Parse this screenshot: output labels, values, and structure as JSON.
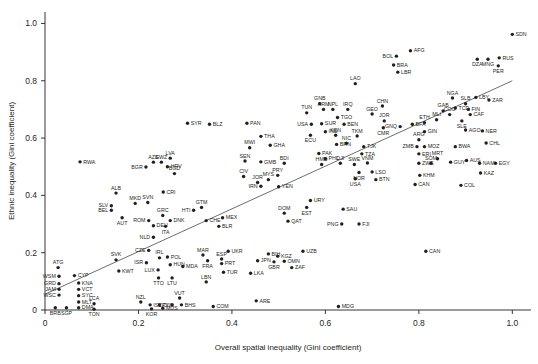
{
  "chart_data": {
    "type": "scatter",
    "title": "",
    "xlabel": "Overall spatial inequality (Gini coefficient)",
    "ylabel": "Ethnic inequality (Gini coefficient)",
    "xlim": [
      0,
      1.04
    ],
    "ylim": [
      0,
      1.04
    ],
    "xticks": [
      "0",
      "0.2",
      "0.4",
      "0.6",
      "0.8",
      "1.0"
    ],
    "xtickvals": [
      0,
      0.2,
      0.4,
      0.6,
      0.8,
      1.0
    ],
    "yticks": [
      "0",
      "0.2",
      "0.4",
      "0.6",
      "0.8",
      "1.0"
    ],
    "ytickvals": [
      0,
      0.2,
      0.4,
      0.6,
      0.8,
      1.0
    ],
    "grid": false,
    "legend": "none",
    "point_color": "#231f20",
    "trendline_color": "#6d6e71",
    "trendline": {
      "x0": 0.0,
      "y0": 0.055,
      "x1": 1.0,
      "y1": 0.8
    },
    "points": [
      {
        "label": "RWA",
        "x": 0.075,
        "y": 0.517,
        "lp": "r"
      },
      {
        "label": "SYR",
        "x": 0.305,
        "y": 0.652,
        "lp": "r"
      },
      {
        "label": "BLZ",
        "x": 0.352,
        "y": 0.648,
        "lp": "r"
      },
      {
        "label": "PAN",
        "x": 0.432,
        "y": 0.652,
        "lp": "r"
      },
      {
        "label": "THA",
        "x": 0.462,
        "y": 0.606,
        "lp": "r"
      },
      {
        "label": "GHA",
        "x": 0.482,
        "y": 0.575,
        "lp": "r"
      },
      {
        "label": "MWI",
        "x": 0.438,
        "y": 0.566,
        "lp": "t"
      },
      {
        "label": "SEN",
        "x": 0.428,
        "y": 0.52,
        "lp": "t"
      },
      {
        "label": "GMB",
        "x": 0.462,
        "y": 0.517,
        "lp": "r"
      },
      {
        "label": "BDI",
        "x": 0.512,
        "y": 0.512,
        "lp": "t"
      },
      {
        "label": "LVA",
        "x": 0.268,
        "y": 0.53,
        "lp": "t"
      },
      {
        "label": "AZE",
        "x": 0.232,
        "y": 0.516,
        "lp": "t"
      },
      {
        "label": "SWZ",
        "x": 0.249,
        "y": 0.516,
        "lp": "t"
      },
      {
        "label": "HRV",
        "x": 0.262,
        "y": 0.5,
        "lp": "r"
      },
      {
        "label": "BGR",
        "x": 0.216,
        "y": 0.499,
        "lp": "l"
      },
      {
        "label": "BGD",
        "x": 0.277,
        "y": 0.476,
        "lp": "t"
      },
      {
        "label": "CIV",
        "x": 0.425,
        "y": 0.466,
        "lp": "t"
      },
      {
        "label": "JOR",
        "x": 0.455,
        "y": 0.445,
        "lp": "t"
      },
      {
        "label": "MYS",
        "x": 0.478,
        "y": 0.455,
        "lp": "t"
      },
      {
        "label": "PRY",
        "x": 0.498,
        "y": 0.47,
        "lp": "t"
      },
      {
        "label": "IRN",
        "x": 0.462,
        "y": 0.432,
        "lp": "l"
      },
      {
        "label": "YEN",
        "x": 0.5,
        "y": 0.43,
        "lp": "r"
      },
      {
        "label": "TUN",
        "x": 0.56,
        "y": 0.688,
        "lp": "t"
      },
      {
        "label": "GNB",
        "x": 0.588,
        "y": 0.72,
        "lp": "t"
      },
      {
        "label": "ARM",
        "x": 0.596,
        "y": 0.7,
        "lp": "t"
      },
      {
        "label": "NPL",
        "x": 0.616,
        "y": 0.7,
        "lp": "t"
      },
      {
        "label": "IRQ",
        "x": 0.648,
        "y": 0.7,
        "lp": "t"
      },
      {
        "label": "USA",
        "x": 0.57,
        "y": 0.648,
        "lp": "l"
      },
      {
        "label": "SUR",
        "x": 0.592,
        "y": 0.65,
        "lp": "r"
      },
      {
        "label": "TGO",
        "x": 0.626,
        "y": 0.672,
        "lp": "r"
      },
      {
        "label": "BEN",
        "x": 0.64,
        "y": 0.648,
        "lp": "r"
      },
      {
        "label": "ECU",
        "x": 0.568,
        "y": 0.61,
        "lp": "b"
      },
      {
        "label": "IND",
        "x": 0.6,
        "y": 0.622,
        "lp": "r"
      },
      {
        "label": "KEN",
        "x": 0.622,
        "y": 0.61,
        "lp": "t"
      },
      {
        "label": "BRN",
        "x": 0.624,
        "y": 0.578,
        "lp": "r"
      },
      {
        "label": "NIC",
        "x": 0.645,
        "y": 0.582,
        "lp": "t"
      },
      {
        "label": "TKM",
        "x": 0.668,
        "y": 0.607,
        "lp": "t"
      },
      {
        "label": "TJK",
        "x": 0.682,
        "y": 0.57,
        "lp": "r"
      },
      {
        "label": "TZA",
        "x": 0.678,
        "y": 0.545,
        "lp": "r"
      },
      {
        "label": "PAK",
        "x": 0.586,
        "y": 0.546,
        "lp": "r"
      },
      {
        "label": "PHL",
        "x": 0.6,
        "y": 0.528,
        "lp": "r"
      },
      {
        "label": "HMD",
        "x": 0.592,
        "y": 0.508,
        "lp": "t"
      },
      {
        "label": "DJI",
        "x": 0.632,
        "y": 0.512,
        "lp": "t"
      },
      {
        "label": "SWE",
        "x": 0.662,
        "y": 0.508,
        "lp": "t"
      },
      {
        "label": "VNM",
        "x": 0.69,
        "y": 0.513,
        "lp": "t"
      },
      {
        "label": "NOR",
        "x": 0.672,
        "y": 0.48,
        "lp": "b"
      },
      {
        "label": "LSO",
        "x": 0.7,
        "y": 0.482,
        "lp": "r"
      },
      {
        "label": "USA2",
        "x": 0.664,
        "y": 0.458,
        "lp": "b"
      },
      {
        "label": "GEO",
        "x": 0.7,
        "y": 0.684,
        "lp": "t"
      },
      {
        "label": "CHN",
        "x": 0.722,
        "y": 0.712,
        "lp": "t"
      },
      {
        "label": "JOR2",
        "x": 0.726,
        "y": 0.66,
        "lp": "t"
      },
      {
        "label": "CMR",
        "x": 0.724,
        "y": 0.636,
        "lp": "b"
      },
      {
        "label": "GNQ",
        "x": 0.76,
        "y": 0.64,
        "lp": "l"
      },
      {
        "label": "BFA",
        "x": 0.786,
        "y": 0.648,
        "lp": "r"
      },
      {
        "label": "ETH",
        "x": 0.812,
        "y": 0.654,
        "lp": "t"
      },
      {
        "label": "GIN",
        "x": 0.812,
        "y": 0.622,
        "lp": "r"
      },
      {
        "label": "MLI",
        "x": 0.838,
        "y": 0.664,
        "lp": "t"
      },
      {
        "label": "ARG",
        "x": 0.8,
        "y": 0.594,
        "lp": "t"
      },
      {
        "label": "ZMB",
        "x": 0.796,
        "y": 0.57,
        "lp": "l"
      },
      {
        "label": "MOZ",
        "x": 0.812,
        "y": 0.57,
        "lp": "r"
      },
      {
        "label": "ERI",
        "x": 0.8,
        "y": 0.545,
        "lp": "r"
      },
      {
        "label": "ZWE",
        "x": 0.8,
        "y": 0.512,
        "lp": "r"
      },
      {
        "label": "SOM",
        "x": 0.826,
        "y": 0.512,
        "lp": "t"
      },
      {
        "label": "KHM",
        "x": 0.802,
        "y": 0.47,
        "lp": "r"
      },
      {
        "label": "BTN",
        "x": 0.708,
        "y": 0.455,
        "lp": "r"
      },
      {
        "label": "CAN",
        "x": 0.792,
        "y": 0.438,
        "lp": "r"
      },
      {
        "label": "LAO",
        "x": 0.664,
        "y": 0.79,
        "lp": "t"
      },
      {
        "label": "BOL",
        "x": 0.752,
        "y": 0.886,
        "lp": "l"
      },
      {
        "label": "AFG",
        "x": 0.782,
        "y": 0.905,
        "lp": "r"
      },
      {
        "label": "BRA",
        "x": 0.746,
        "y": 0.855,
        "lp": "r"
      },
      {
        "label": "LBR",
        "x": 0.755,
        "y": 0.83,
        "lp": "r"
      },
      {
        "label": "NGA",
        "x": 0.872,
        "y": 0.74,
        "lp": "t"
      },
      {
        "label": "TCD",
        "x": 0.878,
        "y": 0.705,
        "lp": "r"
      },
      {
        "label": "GAB",
        "x": 0.852,
        "y": 0.695,
        "lp": "t"
      },
      {
        "label": "COG",
        "x": 0.866,
        "y": 0.682,
        "lp": "t"
      },
      {
        "label": "SLB",
        "x": 0.9,
        "y": 0.72,
        "lp": "t"
      },
      {
        "label": "FIN",
        "x": 0.906,
        "y": 0.7,
        "lp": "r"
      },
      {
        "label": "LBY",
        "x": 0.922,
        "y": 0.742,
        "lp": "r"
      },
      {
        "label": "ZAR",
        "x": 0.95,
        "y": 0.733,
        "lp": "r"
      },
      {
        "label": "CAF",
        "x": 0.91,
        "y": 0.682,
        "lp": "r"
      },
      {
        "label": "SLE",
        "x": 0.892,
        "y": 0.66,
        "lp": "b"
      },
      {
        "label": "AGO",
        "x": 0.9,
        "y": 0.628,
        "lp": "r"
      },
      {
        "label": "MRT",
        "x": 0.84,
        "y": 0.528,
        "lp": "t"
      },
      {
        "label": "BWA",
        "x": 0.878,
        "y": 0.57,
        "lp": "r"
      },
      {
        "label": "NER",
        "x": 0.936,
        "y": 0.625,
        "lp": "r"
      },
      {
        "label": "CHL",
        "x": 0.944,
        "y": 0.583,
        "lp": "r"
      },
      {
        "label": "GUY",
        "x": 0.868,
        "y": 0.516,
        "lp": "r"
      },
      {
        "label": "AUS",
        "x": 0.902,
        "y": 0.522,
        "lp": "r"
      },
      {
        "label": "NAM",
        "x": 0.93,
        "y": 0.512,
        "lp": "r"
      },
      {
        "label": "EGY",
        "x": 0.964,
        "y": 0.512,
        "lp": "r"
      },
      {
        "label": "KAZ",
        "x": 0.932,
        "y": 0.478,
        "lp": "r"
      },
      {
        "label": "COL",
        "x": 0.89,
        "y": 0.435,
        "lp": "r"
      },
      {
        "label": "SDN",
        "x": 1.0,
        "y": 0.962,
        "lp": "r"
      },
      {
        "label": "DZA",
        "x": 0.925,
        "y": 0.875,
        "lp": "b"
      },
      {
        "label": "MNG",
        "x": 0.948,
        "y": 0.875,
        "lp": "b"
      },
      {
        "label": "RUS",
        "x": 0.972,
        "y": 0.88,
        "lp": "r"
      },
      {
        "label": "PER",
        "x": 0.97,
        "y": 0.852,
        "lp": "b"
      },
      {
        "label": "ALB",
        "x": 0.152,
        "y": 0.408,
        "lp": "t"
      },
      {
        "label": "CRI",
        "x": 0.253,
        "y": 0.412,
        "lp": "r"
      },
      {
        "label": "SLV",
        "x": 0.142,
        "y": 0.364,
        "lp": "l"
      },
      {
        "label": "BEL",
        "x": 0.142,
        "y": 0.348,
        "lp": "l"
      },
      {
        "label": "MKD",
        "x": 0.193,
        "y": 0.372,
        "lp": "t"
      },
      {
        "label": "SVN",
        "x": 0.22,
        "y": 0.375,
        "lp": "t"
      },
      {
        "label": "AUT",
        "x": 0.165,
        "y": 0.322,
        "lp": "b"
      },
      {
        "label": "GRC",
        "x": 0.252,
        "y": 0.33,
        "lp": "t"
      },
      {
        "label": "ROM",
        "x": 0.222,
        "y": 0.312,
        "lp": "l"
      },
      {
        "label": "DNK",
        "x": 0.268,
        "y": 0.312,
        "lp": "r"
      },
      {
        "label": "DEU",
        "x": 0.232,
        "y": 0.294,
        "lp": "r"
      },
      {
        "label": "ITA",
        "x": 0.258,
        "y": 0.292,
        "lp": "b"
      },
      {
        "label": "NLD",
        "x": 0.232,
        "y": 0.254,
        "lp": "l"
      },
      {
        "label": "CHE",
        "x": 0.345,
        "y": 0.312,
        "lp": "r"
      },
      {
        "label": "CZE",
        "x": 0.222,
        "y": 0.208,
        "lp": "l"
      },
      {
        "label": "SVK",
        "x": 0.152,
        "y": 0.175,
        "lp": "t"
      },
      {
        "label": "ISR",
        "x": 0.217,
        "y": 0.165,
        "lp": "l"
      },
      {
        "label": "IRL",
        "x": 0.245,
        "y": 0.182,
        "lp": "t"
      },
      {
        "label": "POL",
        "x": 0.262,
        "y": 0.185,
        "lp": "r"
      },
      {
        "label": "HUN",
        "x": 0.268,
        "y": 0.158,
        "lp": "r"
      },
      {
        "label": "MDA",
        "x": 0.295,
        "y": 0.152,
        "lp": "r"
      },
      {
        "label": "LUX",
        "x": 0.242,
        "y": 0.14,
        "lp": "l"
      },
      {
        "label": "TTO",
        "x": 0.243,
        "y": 0.112,
        "lp": "b"
      },
      {
        "label": "LTU",
        "x": 0.272,
        "y": 0.112,
        "lp": "b"
      },
      {
        "label": "KWT",
        "x": 0.158,
        "y": 0.136,
        "lp": "r"
      },
      {
        "label": "MAR",
        "x": 0.338,
        "y": 0.192,
        "lp": "t"
      },
      {
        "label": "FRA",
        "x": 0.348,
        "y": 0.172,
        "lp": "b"
      },
      {
        "label": "ESP",
        "x": 0.378,
        "y": 0.178,
        "lp": "t"
      },
      {
        "label": "PRT",
        "x": 0.378,
        "y": 0.162,
        "lp": "r"
      },
      {
        "label": "UKR",
        "x": 0.392,
        "y": 0.205,
        "lp": "r"
      },
      {
        "label": "TUR",
        "x": 0.382,
        "y": 0.132,
        "lp": "r"
      },
      {
        "label": "JPN",
        "x": 0.455,
        "y": 0.172,
        "lp": "r"
      },
      {
        "label": "BIH",
        "x": 0.478,
        "y": 0.196,
        "lp": "r"
      },
      {
        "label": "KGZ",
        "x": 0.498,
        "y": 0.188,
        "lp": "r"
      },
      {
        "label": "GBR",
        "x": 0.49,
        "y": 0.168,
        "lp": "b"
      },
      {
        "label": "OMN",
        "x": 0.512,
        "y": 0.17,
        "lp": "r"
      },
      {
        "label": "ZAF",
        "x": 0.528,
        "y": 0.148,
        "lp": "r"
      },
      {
        "label": "UZB",
        "x": 0.552,
        "y": 0.205,
        "lp": "r"
      },
      {
        "label": "LKA",
        "x": 0.44,
        "y": 0.128,
        "lp": "r"
      },
      {
        "label": "ATG",
        "x": 0.028,
        "y": 0.148,
        "lp": "t"
      },
      {
        "label": "WSM",
        "x": 0.03,
        "y": 0.118,
        "lp": "l"
      },
      {
        "label": "CYP",
        "x": 0.063,
        "y": 0.12,
        "lp": "r"
      },
      {
        "label": "GRD",
        "x": 0.03,
        "y": 0.092,
        "lp": "l"
      },
      {
        "label": "JAM",
        "x": 0.03,
        "y": 0.072,
        "lp": "l"
      },
      {
        "label": "KNA",
        "x": 0.072,
        "y": 0.094,
        "lp": "r"
      },
      {
        "label": "VCT",
        "x": 0.072,
        "y": 0.072,
        "lp": "r"
      },
      {
        "label": "WSC",
        "x": 0.03,
        "y": 0.052,
        "lp": "l"
      },
      {
        "label": "SYC",
        "x": 0.072,
        "y": 0.05,
        "lp": "r"
      },
      {
        "label": "MLT",
        "x": 0.072,
        "y": 0.028,
        "lp": "r"
      },
      {
        "label": "BRB",
        "x": 0.022,
        "y": 0.008,
        "lp": "b"
      },
      {
        "label": "SGP",
        "x": 0.046,
        "y": 0.008,
        "lp": "b"
      },
      {
        "label": "DMA",
        "x": 0.072,
        "y": 0.008,
        "lp": "r"
      },
      {
        "label": "LCA",
        "x": 0.105,
        "y": 0.022,
        "lp": "t"
      },
      {
        "label": "TON",
        "x": 0.105,
        "y": 0.003,
        "lp": "b"
      },
      {
        "label": "NZL",
        "x": 0.205,
        "y": 0.028,
        "lp": "t"
      },
      {
        "label": "ISL",
        "x": 0.225,
        "y": 0.018,
        "lp": "r"
      },
      {
        "label": "CUB",
        "x": 0.245,
        "y": 0.018,
        "lp": "r"
      },
      {
        "label": "KOR",
        "x": 0.228,
        "y": 0.004,
        "lp": "b"
      },
      {
        "label": "MUS",
        "x": 0.252,
        "y": 0.006,
        "lp": "r"
      },
      {
        "label": "LBN",
        "x": 0.345,
        "y": 0.098,
        "lp": "t"
      },
      {
        "label": "VUT",
        "x": 0.288,
        "y": 0.042,
        "lp": "t"
      },
      {
        "label": "CPV",
        "x": 0.272,
        "y": 0.018,
        "lp": "l"
      },
      {
        "label": "BHS",
        "x": 0.292,
        "y": 0.018,
        "lp": "r"
      },
      {
        "label": "COM",
        "x": 0.36,
        "y": 0.012,
        "lp": "r"
      },
      {
        "label": "ARE",
        "x": 0.452,
        "y": 0.032,
        "lp": "r"
      },
      {
        "label": "MDG",
        "x": 0.628,
        "y": 0.012,
        "lp": "r"
      },
      {
        "label": "HTI",
        "x": 0.318,
        "y": 0.348,
        "lp": "l"
      },
      {
        "label": "GTM",
        "x": 0.335,
        "y": 0.358,
        "lp": "t"
      },
      {
        "label": "MEX",
        "x": 0.38,
        "y": 0.322,
        "lp": "r"
      },
      {
        "label": "BLR",
        "x": 0.372,
        "y": 0.292,
        "lp": "r"
      },
      {
        "label": "DOM",
        "x": 0.512,
        "y": 0.338,
        "lp": "t"
      },
      {
        "label": "QAT",
        "x": 0.52,
        "y": 0.31,
        "lp": "r"
      },
      {
        "label": "EST",
        "x": 0.56,
        "y": 0.358,
        "lp": "b"
      },
      {
        "label": "URY",
        "x": 0.568,
        "y": 0.382,
        "lp": "r"
      },
      {
        "label": "SAU",
        "x": 0.638,
        "y": 0.352,
        "lp": "r"
      },
      {
        "label": "PNG",
        "x": 0.635,
        "y": 0.3,
        "lp": "l"
      },
      {
        "label": "FJI",
        "x": 0.672,
        "y": 0.3,
        "lp": "r"
      },
      {
        "label": "CAN2",
        "x": 0.815,
        "y": 0.205,
        "lp": "r"
      }
    ]
  }
}
